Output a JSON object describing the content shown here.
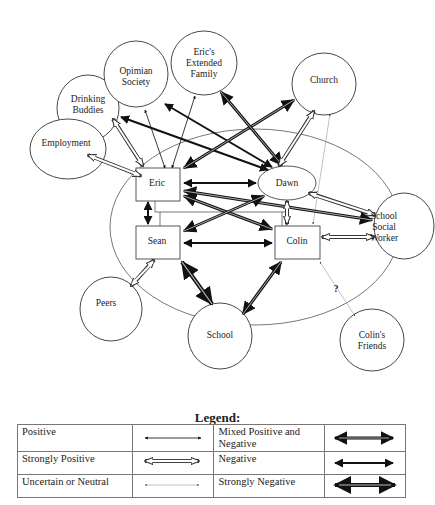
{
  "nodes": {
    "opimian_society": {
      "lines": [
        "Opimian",
        "Society"
      ]
    },
    "erics_extended_family": {
      "lines": [
        "Eric's",
        "Extended",
        "Family"
      ]
    },
    "drinking_buddies": {
      "lines": [
        "Drinking",
        "Buddies"
      ]
    },
    "church": {
      "lines": [
        "Church"
      ]
    },
    "employment": {
      "lines": [
        "Employment"
      ]
    },
    "eric": {
      "lines": [
        "Eric"
      ]
    },
    "dawn": {
      "lines": [
        "Dawn"
      ]
    },
    "sean": {
      "lines": [
        "Sean"
      ]
    },
    "colin": {
      "lines": [
        "Colin"
      ]
    },
    "school_social_worker": {
      "lines": [
        "School",
        "Social",
        "Worker"
      ]
    },
    "peers": {
      "lines": [
        "Peers"
      ]
    },
    "school": {
      "lines": [
        "School"
      ]
    },
    "colins_friends": {
      "lines": [
        "Colin's",
        "Friends"
      ]
    }
  },
  "uncertain_mark": "?",
  "relationships": [
    {
      "from": "Eric",
      "to": "Drinking Buddies",
      "type": "Strongly Positive"
    },
    {
      "from": "Eric",
      "to": "Employment",
      "type": "Strongly Positive"
    },
    {
      "from": "Eric",
      "to": "Opimian Society",
      "type": "Positive"
    },
    {
      "from": "Eric",
      "to": "Eric's Extended Family",
      "type": "Positive"
    },
    {
      "from": "Eric",
      "to": "Church",
      "type": "Mixed Positive and Negative"
    },
    {
      "from": "Dawn",
      "to": "Drinking Buddies",
      "type": "Negative"
    },
    {
      "from": "Dawn",
      "to": "Opimian Society",
      "type": "Negative"
    },
    {
      "from": "Dawn",
      "to": "Eric's Extended Family",
      "type": "Mixed Positive and Negative"
    },
    {
      "from": "Dawn",
      "to": "Church",
      "type": "Strongly Positive"
    },
    {
      "from": "Colin",
      "to": "Church",
      "type": "Uncertain or Neutral"
    },
    {
      "from": "Eric",
      "to": "Dawn",
      "type": "Negative"
    },
    {
      "from": "Eric",
      "to": "Sean",
      "type": "Negative"
    },
    {
      "from": "Eric",
      "to": "Colin",
      "type": "Mixed Positive and Negative"
    },
    {
      "from": "Eric",
      "to": "School Social Worker",
      "type": "Mixed Positive and Negative"
    },
    {
      "from": "Sean",
      "to": "Dawn",
      "type": "Mixed Positive and Negative"
    },
    {
      "from": "Sean",
      "to": "Colin",
      "type": "Negative"
    },
    {
      "from": "Dawn",
      "to": "Colin",
      "type": "Strongly Positive"
    },
    {
      "from": "Dawn",
      "to": "School Social Worker",
      "type": "Strongly Positive"
    },
    {
      "from": "Colin",
      "to": "School Social Worker",
      "type": "Strongly Positive"
    },
    {
      "from": "Sean",
      "to": "Peers",
      "type": "Strongly Positive"
    },
    {
      "from": "Sean",
      "to": "School",
      "type": "Strongly Negative"
    },
    {
      "from": "Colin",
      "to": "School",
      "type": "Mixed Positive and Negative"
    },
    {
      "from": "Family",
      "to": "Colin's Friends",
      "type": "Uncertain or Neutral",
      "note": "?"
    }
  ],
  "legend": {
    "title": "Legend:",
    "rows": [
      {
        "left": "Positive",
        "right": "Mixed Positive and Negative"
      },
      {
        "left": "Strongly Positive",
        "right": "Negative"
      },
      {
        "left": "Uncertain or Neutral",
        "right": "Strongly Negative"
      }
    ]
  }
}
